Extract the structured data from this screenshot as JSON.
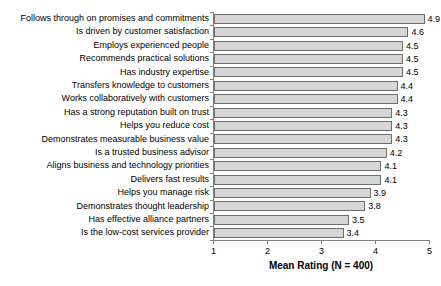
{
  "chart_data": {
    "type": "bar",
    "orientation": "horizontal",
    "title": "",
    "xlabel": "Mean Rating (N = 400)",
    "ylabel": "",
    "xlim": [
      1,
      5
    ],
    "xticks": [
      "1",
      "2",
      "3",
      "4",
      "5"
    ],
    "grid": false,
    "legend": false,
    "value_labels_shown": true,
    "categories": [
      "Follows through on promises and commitments",
      "Is driven by customer satisfaction",
      "Employs experienced people",
      "Recommends practical solutions",
      "Has industry expertise",
      "Transfers knowledge to customers",
      "Works collaboratively with customers",
      "Has a strong reputation built on trust",
      "Helps you reduce cost",
      "Demonstrates measurable business value",
      "Is a trusted business advisor",
      "Aligns business and technology priorities",
      "Delivers fast results",
      "Helps you manage risk",
      "Demonstrates thought leadership",
      "Has effective alliance partners",
      "Is the low-cost services provider"
    ],
    "values": [
      4.9,
      4.6,
      4.5,
      4.5,
      4.5,
      4.4,
      4.4,
      4.3,
      4.3,
      4.3,
      4.2,
      4.1,
      4.1,
      3.9,
      3.8,
      3.5,
      3.4
    ],
    "value_labels": [
      "4.9",
      "4.6",
      "4.5",
      "4.5",
      "4.5",
      "4.4",
      "4.4",
      "4.3",
      "4.3",
      "4.3",
      "4.2",
      "4.1",
      "4.1",
      "3.9",
      "3.8",
      "3.5",
      "3.4"
    ],
    "colors": {
      "bar_fill": "#d6d6d6",
      "bar_border": "#6e6e6e",
      "axis": "#808080",
      "text": "#000000",
      "background": "#ffffff"
    }
  }
}
